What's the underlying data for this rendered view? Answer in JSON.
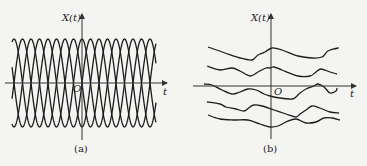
{
  "panels": [
    {
      "id": "a",
      "caption": "(a)",
      "y_axis_label": "X(t)",
      "x_axis_label": "t",
      "origin_label": "O",
      "description": "Ensemble of sinusoidal sample functions with random phase, equal amplitude and frequency",
      "axis": {
        "origin_x": 82,
        "origin_y": 83,
        "x_start": 5,
        "x_end": 167,
        "y_top": 14,
        "y_bottom": 140
      },
      "waves": {
        "count": 4,
        "amplitude": 44,
        "period": 34,
        "x_start": 12,
        "x_end": 156,
        "phases_deg": [
          0,
          90,
          180,
          270
        ]
      }
    },
    {
      "id": "b",
      "caption": "(b)",
      "y_axis_label": "X(t)",
      "x_axis_label": "t",
      "origin_label": "O",
      "description": "Ensemble of random (irregular) sample functions",
      "axis": {
        "origin_x": 271,
        "origin_y": 86,
        "x_start": 193,
        "x_end": 356,
        "y_top": 14,
        "y_bottom": 139
      },
      "curves": [
        [
          [
            208,
            47
          ],
          [
            225,
            53
          ],
          [
            240,
            58
          ],
          [
            252,
            60
          ],
          [
            258,
            55
          ],
          [
            265,
            52
          ],
          [
            272,
            48
          ],
          [
            282,
            50
          ],
          [
            298,
            56
          ],
          [
            312,
            58
          ],
          [
            322,
            57
          ],
          [
            328,
            51
          ],
          [
            338,
            48
          ],
          [
            335,
            49
          ]
        ],
        [
          [
            207,
            66
          ],
          [
            220,
            70
          ],
          [
            232,
            68
          ],
          [
            240,
            71
          ],
          [
            250,
            76
          ],
          [
            258,
            72
          ],
          [
            266,
            68
          ],
          [
            270,
            68
          ],
          [
            274,
            67
          ],
          [
            282,
            70
          ],
          [
            298,
            76
          ],
          [
            310,
            76
          ],
          [
            316,
            72
          ],
          [
            321,
            69
          ],
          [
            330,
            72
          ],
          [
            337,
            74
          ]
        ],
        [
          [
            204,
            84
          ],
          [
            212,
            85
          ],
          [
            222,
            90
          ],
          [
            232,
            94
          ],
          [
            240,
            92
          ],
          [
            248,
            89
          ],
          [
            256,
            90
          ],
          [
            264,
            94
          ],
          [
            270,
            96
          ],
          [
            280,
            98
          ],
          [
            292,
            99
          ],
          [
            296,
            97
          ],
          [
            300,
            93
          ],
          [
            306,
            89
          ],
          [
            314,
            86
          ],
          [
            318,
            84
          ],
          [
            324,
            87
          ],
          [
            330,
            93
          ],
          [
            336,
            91
          ],
          [
            337,
            88
          ]
        ],
        [
          [
            207,
            102
          ],
          [
            220,
            104
          ],
          [
            226,
            107
          ],
          [
            236,
            109
          ],
          [
            244,
            111
          ],
          [
            250,
            107
          ],
          [
            254,
            105
          ],
          [
            262,
            106
          ],
          [
            274,
            110
          ],
          [
            286,
            114
          ],
          [
            296,
            117
          ],
          [
            300,
            114
          ],
          [
            306,
            110
          ],
          [
            312,
            106
          ],
          [
            320,
            108
          ],
          [
            330,
            112
          ],
          [
            339,
            113
          ]
        ],
        [
          [
            208,
            115
          ],
          [
            220,
            119
          ],
          [
            234,
            120
          ],
          [
            248,
            120
          ],
          [
            260,
            124
          ],
          [
            270,
            127
          ],
          [
            278,
            126
          ],
          [
            286,
            122
          ],
          [
            296,
            119
          ],
          [
            306,
            123
          ],
          [
            316,
            122
          ],
          [
            324,
            118
          ],
          [
            332,
            118
          ],
          [
            340,
            120
          ]
        ]
      ]
    }
  ],
  "colors": {
    "ink": "#1c1c1c",
    "background": "#f4f4f2"
  }
}
